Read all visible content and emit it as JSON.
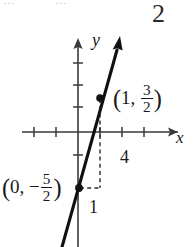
{
  "figure": {
    "title_number": "2",
    "cropped_top_text": {
      "left_fragment": "...",
      "right_fragment": "..."
    },
    "axes": {
      "x_label": "x",
      "y_label": "y",
      "origin_px": [
        78,
        132
      ],
      "tick_spacing_px": 22,
      "x_ticks_px": [
        34,
        56,
        100,
        122,
        144
      ],
      "y_ticks_px": [
        63,
        85,
        107,
        155
      ],
      "x_arrow": "right",
      "y_arrow": "up"
    },
    "line": {
      "description": "steep increasing line",
      "slope": "4",
      "y_intercept": "-5/2",
      "arrow": "up",
      "points_px": [
        [
          62,
          247
        ],
        [
          120,
          40
        ]
      ]
    },
    "points": [
      {
        "name": "point-on-line",
        "x": "1",
        "y_numerator": "3",
        "y_denominator": "2",
        "label_open": "(",
        "label_sep": ", ",
        "label_close": ")",
        "px": [
          100,
          98
        ]
      },
      {
        "name": "y-intercept",
        "x": "0",
        "y_sign": "−",
        "y_numerator": "5",
        "y_denominator": "2",
        "label_open": "(",
        "label_sep": ", ",
        "label_close": ")",
        "px": [
          79,
          188
        ]
      }
    ],
    "slope_triangle": {
      "rise_label": "4",
      "run_label": "1",
      "style": "dashed",
      "vertical_px": [
        100,
        98,
        100,
        188
      ],
      "horizontal_px": [
        79,
        188,
        100,
        188
      ]
    },
    "colors": {
      "ink": "#1a1a1a",
      "axis": "#3a3a3a",
      "dashed": "#2b2b2b",
      "background": "#ffffff",
      "faint": "#b9b9b9"
    }
  }
}
